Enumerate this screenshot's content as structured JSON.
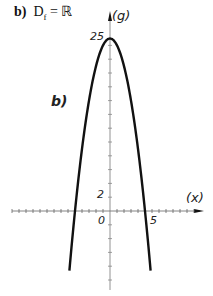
{
  "title": {
    "part": "b)",
    "text": "D",
    "sub": "f",
    "rest": " = ℝ"
  },
  "curve_label": "b)",
  "axis_labels": {
    "y": "(g)",
    "x": "(x)"
  },
  "tick_labels": {
    "y_top": "25",
    "y_small": "2",
    "origin": "0",
    "x5": "5"
  },
  "chart_data": {
    "type": "line",
    "xlabel": "(x)",
    "ylabel": "(g)",
    "function": "y = 25 - x^2",
    "series": [
      {
        "name": "b)",
        "x": [
          -5.5,
          -5,
          -4,
          -3,
          -2,
          -1,
          0,
          1,
          2,
          3,
          4,
          5,
          5.5
        ],
        "values": [
          -5.25,
          0,
          9,
          16,
          21,
          24,
          25,
          24,
          21,
          16,
          9,
          0,
          -5.25
        ]
      }
    ],
    "labeled_ticks": {
      "x": [
        0,
        5
      ],
      "y": [
        2,
        25
      ]
    },
    "xlim": [
      -15,
      14
    ],
    "ylim": [
      -12,
      28
    ],
    "grid": false
  }
}
